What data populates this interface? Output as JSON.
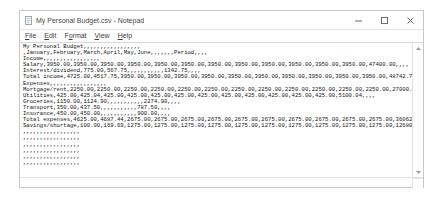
{
  "window": {
    "title": "My Personal Budget.csv - Notepad",
    "app_icon": "notepad-icon",
    "controls": {
      "minimize": "minimize-icon",
      "maximize": "maximize-icon",
      "close": "close-icon"
    }
  },
  "menu": {
    "items": [
      {
        "label": "File",
        "mnemonic": "F",
        "rest": "ile"
      },
      {
        "label": "Edit",
        "mnemonic": "E",
        "rest": "dit"
      },
      {
        "label": "Format",
        "mnemonic": "o",
        "pre": "F",
        "rest": "rmat"
      },
      {
        "label": "View",
        "mnemonic": "V",
        "rest": "iew"
      },
      {
        "label": "Help",
        "mnemonic": "H",
        "rest": "elp"
      }
    ]
  },
  "document": {
    "lines": [
      "My Personal Budget,,,,,,,,,,,,,,,,,",
      ",January,February,March,April,May,June,,,,,,,Period,,,,",
      "Income,,,,,,,,,,,,,,,,,",
      "Salary,3950.00,3950.00,3950.00,3950.00,3950.00,3950.00,3950.00,3950.00,3950.00,3950.00,3950.00,3950.00,47400.00,,,,",
      "Interest/dividend,775.00,567.75,,,,,,,,,,,1342.75,,,,",
      "Total income,4725.00,4517.75,3950.00,3950.00,3950.00,3950.00,3950.00,3950.00,3950.00,3950.00,3950.00,3950.00,48742.75,,,,",
      "Expenses,,,,,,,,,,,,,,,,,",
      "Mortgage/rent,2250.00,2250.00,2250.00,2250.00,2250.00,2250.00,2250.00,2250.00,2250.00,2250.00,2250.00,2250.00,27000.00,,,,",
      "Utilities,425.00,425.04,425.00,425.00,425.00,425.00,425.00,425.00,425.00,425.00,425.00,425.00,5100.04,,,,",
      "Groceries,1150.00,1124.90,,,,,,,,,,,2274.90,,,,",
      "Transport,350.00,437.50,,,,,,,,,,,787.50,,,,",
      "Insurance,450.00,450.00,,,,,,,,,,,900.00,,,,",
      "Total expenses,4625.00,4687.44,2675.00,2675.00,2675.00,2675.00,2675.00,2675.00,2675.00,2675.00,2675.00,2675.00,36062.44,,,,",
      "Savings/shortage,100.00,169.69,1275.00,1275.00,1275.00,1275.00,1275.00,1275.00,1275.00,1275.00,1275.00,1275.00,12680.31,,,,",
      ",,,,,,,,,,,,,,,,,",
      ",,,,,,,,,,,,,,,,,",
      ",,,,,,,,,,,,,,,,,",
      ",,,,,,,,,,,,,,,,,",
      ",,,,,,,,,,,,,,,,,",
      ",,,,,,,,,,,,,,,,,"
    ]
  },
  "scrollbars": {
    "vertical_up": "scroll-up-arrow-icon",
    "vertical_down": "scroll-down-arrow-icon"
  }
}
